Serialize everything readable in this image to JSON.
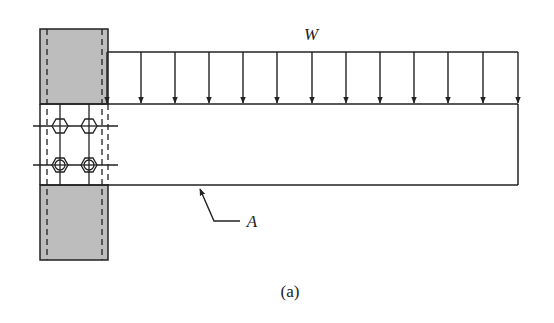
{
  "figure": {
    "load_label": "W",
    "member_label": "A",
    "caption": "(a)",
    "colors": {
      "line": "#222222",
      "column_fill": "#bdbdbd",
      "background": "#ffffff"
    },
    "load": {
      "type": "uniformly distributed",
      "arrow_count": 13
    },
    "bolts": {
      "count": 4,
      "rows": 2,
      "columns": 2
    }
  }
}
